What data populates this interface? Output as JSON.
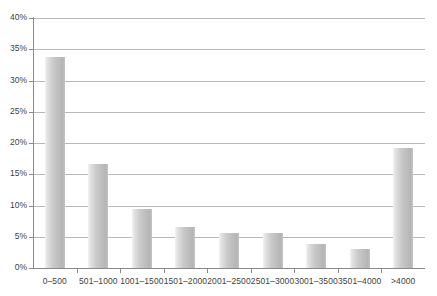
{
  "chart_data": {
    "type": "bar",
    "title": "",
    "subtitle": "",
    "xlabel": "",
    "ylabel": "",
    "categories": [
      "0–500",
      "501–1000",
      "1001–1500",
      "1501–2000",
      "2001–2500",
      "2501–3000",
      "3001–3500",
      "3501–4000",
      ">4000"
    ],
    "values": [
      33.8,
      16.6,
      9.4,
      6.6,
      5.6,
      5.6,
      3.8,
      3.0,
      19.2
    ],
    "value_unit": "%",
    "ylim": [
      0,
      40
    ],
    "ytick_labels": [
      "0%",
      "5%",
      "10%",
      "15%",
      "20%",
      "25%",
      "30%",
      "35%",
      "40%"
    ],
    "ytick_values": [
      0,
      5,
      10,
      15,
      20,
      25,
      30,
      35,
      40
    ],
    "grid": "horizontal",
    "legend": "none",
    "series_color": "#c2c2c2",
    "grid_color": "#b9b9b9",
    "axis_color": "#8a8a8a",
    "text_color": "#3f3f3f"
  }
}
